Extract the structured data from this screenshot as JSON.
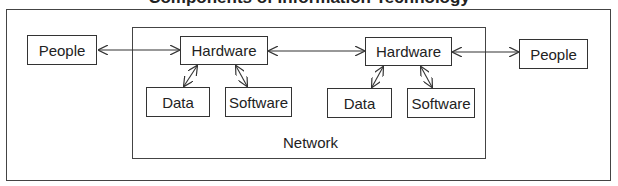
{
  "diagram": {
    "title": "Components of Information Technology",
    "outer_frame": {
      "name": "outer-frame"
    },
    "network": {
      "label": "Network"
    },
    "nodes": [
      {
        "id": "people-left",
        "label": "People"
      },
      {
        "id": "hardware-left",
        "label": "Hardware"
      },
      {
        "id": "data-left",
        "label": "Data"
      },
      {
        "id": "software-left",
        "label": "Software"
      },
      {
        "id": "hardware-right",
        "label": "Hardware"
      },
      {
        "id": "data-right",
        "label": "Data"
      },
      {
        "id": "software-right",
        "label": "Software"
      },
      {
        "id": "people-right",
        "label": "People"
      }
    ],
    "edges": [
      {
        "from": "people-left",
        "to": "hardware-left",
        "type": "bidirectional"
      },
      {
        "from": "hardware-left",
        "to": "hardware-right",
        "type": "bidirectional"
      },
      {
        "from": "hardware-right",
        "to": "people-right",
        "type": "bidirectional"
      },
      {
        "from": "hardware-left",
        "to": "data-left",
        "type": "bidirectional"
      },
      {
        "from": "hardware-left",
        "to": "software-left",
        "type": "bidirectional"
      },
      {
        "from": "hardware-right",
        "to": "data-right",
        "type": "bidirectional"
      },
      {
        "from": "hardware-right",
        "to": "software-right",
        "type": "bidirectional"
      }
    ],
    "colors": {
      "line": "#333333",
      "background": "#ffffff",
      "text": "#222222"
    }
  }
}
